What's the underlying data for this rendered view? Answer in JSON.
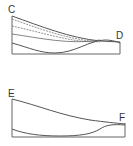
{
  "diagram": {
    "type": "cross-section",
    "line_color": "#555555",
    "panels": [
      {
        "id": "top",
        "labels": {
          "left": "C",
          "right": "D"
        },
        "description": "Section C–D with upper surface, two dashed intermediate lines and a lower undulating boundary"
      },
      {
        "id": "bottom",
        "labels": {
          "left": "E",
          "right": "F"
        },
        "description": "Section E–F with upper surface and a lower undulating boundary"
      }
    ]
  }
}
